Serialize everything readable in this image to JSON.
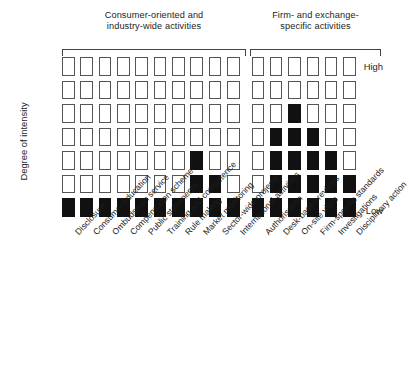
{
  "figure": {
    "y_axis_title": "Degree of intensity",
    "tick_high": "High",
    "tick_low": "Low",
    "group_left_header": "Consumer-oriented and\nindustry-wide activities",
    "group_right_header": "Firm- and exchange-\nspecific activities",
    "fill_color": "#111111",
    "cell_border_color": "#555555",
    "background_color": "#ffffff"
  },
  "chart_data": {
    "type": "heatmap",
    "title": "",
    "subtitle": "",
    "xlabel": "",
    "ylabel": "Degree of intensity",
    "grid": false,
    "legend": "none",
    "ytick_labels": [
      "High",
      "Low"
    ],
    "yaxis_levels": 7,
    "yaxis_direction": "High at top, Low at bottom",
    "value_encoding": {
      "1": "filled (black) — intensity present at this level",
      "0": "empty (white outline) — intensity absent at this level"
    },
    "groups": [
      {
        "name": "Consumer-oriented and industry-wide activities",
        "categories": [
          "Disclosure",
          "Consumer education",
          "Ombudsman service",
          "Compensation scheme",
          "Public statements",
          "Training and competence",
          "Rule making",
          "Market monitoring",
          "Sector-wide projects",
          "International activities"
        ]
      },
      {
        "name": "Firm- and exchange-specific activities",
        "categories": [
          "Authorisation",
          "Desk-based reviews",
          "On-site visits",
          "Firm-specific standards",
          "Investigations",
          "Disciplinary action"
        ]
      }
    ],
    "categories": [
      "Disclosure",
      "Consumer education",
      "Ombudsman service",
      "Compensation scheme",
      "Public statements",
      "Training and competence",
      "Rule making",
      "Market monitoring",
      "Sector-wide projects",
      "International activities",
      "Authorisation",
      "Desk-based reviews",
      "On-site visits",
      "Firm-specific standards",
      "Investigations",
      "Disciplinary action"
    ],
    "intensity_levels": [
      7,
      7,
      7,
      7,
      7,
      7,
      7,
      3,
      2,
      7,
      7,
      3,
      4,
      3,
      3,
      2
    ],
    "matrix_rows_top_to_bottom": [
      {
        "level": 7,
        "label": "High",
        "values": [
          0,
          0,
          0,
          0,
          0,
          0,
          0,
          0,
          0,
          0,
          0,
          0,
          0,
          0,
          0,
          0
        ]
      },
      {
        "level": 6,
        "label": "",
        "values": [
          0,
          0,
          0,
          0,
          0,
          0,
          0,
          0,
          0,
          0,
          0,
          0,
          0,
          0,
          0,
          0
        ]
      },
      {
        "level": 5,
        "label": "",
        "values": [
          0,
          0,
          0,
          0,
          0,
          0,
          0,
          0,
          0,
          0,
          0,
          0,
          1,
          0,
          0,
          0
        ]
      },
      {
        "level": 4,
        "label": "",
        "values": [
          0,
          0,
          0,
          0,
          0,
          0,
          0,
          0,
          0,
          0,
          0,
          1,
          1,
          1,
          0,
          0
        ]
      },
      {
        "level": 3,
        "label": "",
        "values": [
          0,
          0,
          0,
          0,
          0,
          0,
          0,
          1,
          0,
          0,
          0,
          1,
          1,
          1,
          1,
          0
        ]
      },
      {
        "level": 2,
        "label": "",
        "values": [
          0,
          0,
          0,
          0,
          0,
          0,
          0,
          1,
          1,
          0,
          0,
          1,
          1,
          1,
          1,
          1
        ]
      },
      {
        "level": 1,
        "label": "Low",
        "values": [
          1,
          1,
          1,
          1,
          1,
          1,
          1,
          1,
          1,
          1,
          1,
          1,
          1,
          1,
          1,
          1
        ]
      }
    ]
  }
}
